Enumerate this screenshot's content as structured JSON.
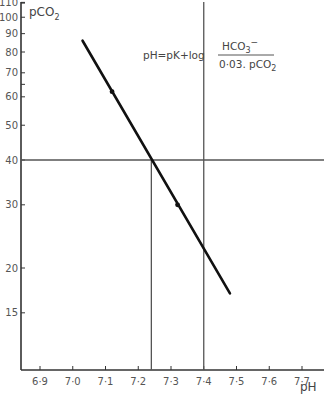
{
  "chart_data": {
    "type": "line",
    "title": "",
    "xlabel": "pH",
    "ylabel": "pCO2",
    "y_scale": "log",
    "xlim": [
      6.85,
      7.78
    ],
    "ylim": [
      11,
      110
    ],
    "grid": false,
    "x_ticks": [
      "6·9",
      "7·0",
      "7·1",
      "7·2",
      "7·3",
      "7·4",
      "7·5",
      "7·6",
      "7·7"
    ],
    "x_tick_values": [
      6.9,
      7.0,
      7.1,
      7.2,
      7.3,
      7.4,
      7.5,
      7.6,
      7.7
    ],
    "y_ticks": [
      "110",
      "100",
      "90",
      "80",
      "70",
      "60",
      "50",
      "40",
      "30",
      "20",
      "15"
    ],
    "y_tick_values": [
      110,
      100,
      90,
      80,
      70,
      60,
      50,
      40,
      30,
      20,
      15
    ],
    "series": [
      {
        "name": "buffer line",
        "x": [
          7.03,
          7.48
        ],
        "y": [
          86,
          17
        ]
      },
      {
        "name": "measured points",
        "x": [
          7.12,
          7.32
        ],
        "y": [
          62,
          30
        ]
      }
    ],
    "reference_lines": {
      "horizontal": [
        {
          "y": 40
        }
      ],
      "vertical": [
        {
          "x": 7.24,
          "from_y": 40
        },
        {
          "x": 7.4
        }
      ]
    },
    "annotations": [
      {
        "text": "pH=pK+log HCO3⁻ / 0·03. pCO2",
        "position": "upper right"
      }
    ]
  },
  "labels": {
    "y_axis_title_main": "pCO",
    "y_axis_title_sub": "2",
    "x_axis_title": "pH",
    "formula_lhs": "pH=pK+log",
    "formula_num_main": "HCO",
    "formula_num_sub": "3",
    "formula_num_sup": "−",
    "formula_den_main": "0·03. pCO",
    "formula_den_sub": "2"
  }
}
